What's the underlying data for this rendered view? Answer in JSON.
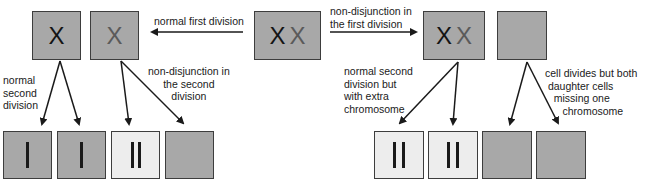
{
  "colors": {
    "cell_grey": "#a8a8a8",
    "cell_light": "#ededed",
    "border": "#3d3d3d",
    "chromosome_dark": "#141414",
    "chromosome_grey": "#5a5a5a",
    "arrow": "#1a1a1a"
  },
  "parent_cell": {
    "chromosomes": [
      "X",
      "X"
    ]
  },
  "left_branch": {
    "first_division_label": "normal first division",
    "cells": [
      {
        "chromosome": "X",
        "tone": "dark"
      },
      {
        "chromosome": "X",
        "tone": "grey"
      }
    ],
    "second_division_labels": {
      "normal": "normal\nsecond\ndivision",
      "nondisjunction": "non-disjunction in\nthe second\ndivision"
    },
    "daughter_cells": [
      {
        "bars": 1,
        "shade": "grey"
      },
      {
        "bars": 1,
        "shade": "grey"
      },
      {
        "bars": 2,
        "shade": "light"
      },
      {
        "bars": 0,
        "shade": "grey"
      }
    ]
  },
  "right_branch": {
    "first_division_label": "non-disjunction in\nthe first division",
    "cells": [
      {
        "chromosomes": [
          "X",
          "X"
        ]
      },
      {
        "chromosomes": []
      }
    ],
    "second_division_labels": {
      "extra": "normal second\ndivision but\nwith extra\nchromosome",
      "missing": "cell divides but both\n daughter cells\n   missing one\n      chromosome"
    },
    "daughter_cells": [
      {
        "bars": 2,
        "shade": "light"
      },
      {
        "bars": 2,
        "shade": "light"
      },
      {
        "bars": 0,
        "shade": "grey"
      },
      {
        "bars": 0,
        "shade": "grey"
      }
    ]
  }
}
